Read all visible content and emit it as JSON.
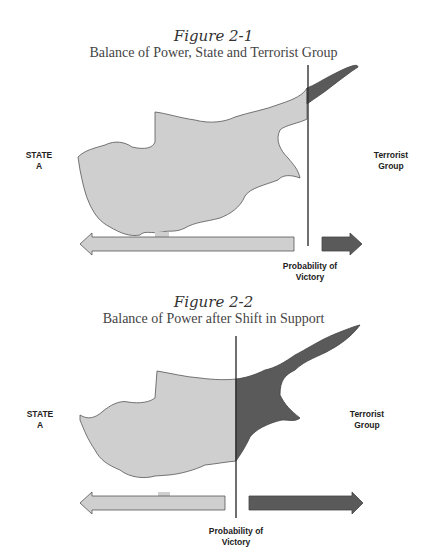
{
  "figures": [
    {
      "title": "Figure 2-1",
      "subtitle": "Balance of Power, State and Terrorist Group",
      "left_label": [
        "STATE",
        "A"
      ],
      "right_label": [
        "Terrorist",
        "Group"
      ],
      "axis_label": [
        "Probability of",
        "Victory"
      ]
    },
    {
      "title": "Figure 2-2",
      "subtitle": "Balance of Power after Shift in Support",
      "left_label": [
        "STATE",
        "A"
      ],
      "right_label": [
        "Terrorist",
        "Group"
      ],
      "axis_label": [
        "Probability of",
        "Victory"
      ]
    }
  ],
  "colors": {
    "state": "#cfcfcf",
    "terrorist": "#5a5a5a",
    "line": "#333333"
  }
}
